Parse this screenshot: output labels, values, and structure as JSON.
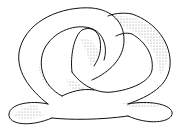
{
  "illustration": {
    "subject": "knotted tube line drawing",
    "colors": {
      "background": "#ffffff",
      "stroke": "#111111",
      "shade": "#555555"
    }
  }
}
